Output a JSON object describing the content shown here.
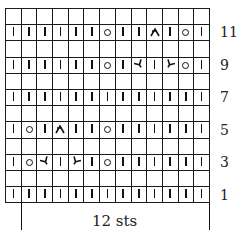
{
  "chart": {
    "columns": 13,
    "rows_top_to_bottom": [
      [
        "",
        "",
        "",
        "",
        "",
        "",
        "",
        "",
        "",
        "",
        "",
        "",
        ""
      ],
      [
        "k",
        "k",
        "k",
        "k",
        "k",
        "k",
        "yo",
        "k",
        "k",
        "s2kp",
        "k",
        "yo",
        "k"
      ],
      [
        "",
        "",
        "",
        "",
        "",
        "",
        "",
        "",
        "",
        "",
        "",
        "",
        ""
      ],
      [
        "k",
        "k",
        "k",
        "k",
        "k",
        "k",
        "yo",
        "k",
        "ssk",
        "k",
        "k2tog",
        "yo",
        "k"
      ],
      [
        "",
        "",
        "",
        "",
        "",
        "",
        "",
        "",
        "",
        "",
        "",
        "",
        ""
      ],
      [
        "k",
        "k",
        "k",
        "k",
        "k",
        "k",
        "k",
        "k",
        "k",
        "k",
        "k",
        "k",
        "k"
      ],
      [
        "",
        "",
        "",
        "",
        "",
        "",
        "",
        "",
        "",
        "",
        "",
        "",
        ""
      ],
      [
        "k",
        "yo",
        "k",
        "s2kp",
        "k",
        "k",
        "yo",
        "k",
        "k",
        "k",
        "k",
        "k",
        "k"
      ],
      [
        "",
        "",
        "",
        "",
        "",
        "",
        "",
        "",
        "",
        "",
        "",
        "",
        ""
      ],
      [
        "k",
        "yo",
        "ssk",
        "k",
        "k2tog",
        "k",
        "yo",
        "k",
        "k",
        "k",
        "k",
        "k",
        "k"
      ],
      [
        "",
        "",
        "",
        "",
        "",
        "",
        "",
        "",
        "",
        "",
        "",
        "",
        ""
      ],
      [
        "k",
        "k",
        "k",
        "k",
        "k",
        "k",
        "k",
        "k",
        "k",
        "k",
        "k",
        "k",
        "k"
      ]
    ],
    "row_labels": [
      {
        "label": "11",
        "row_index": 1
      },
      {
        "label": "9",
        "row_index": 3
      },
      {
        "label": "7",
        "row_index": 5
      },
      {
        "label": "5",
        "row_index": 7
      },
      {
        "label": "3",
        "row_index": 9
      },
      {
        "label": "1",
        "row_index": 11
      }
    ],
    "repeat_label": "12 sts",
    "symbols": {
      "k": "knit",
      "yo": "yarn over",
      "ssk": "slip slip knit",
      "k2tog": "knit two together",
      "s2kp": "centered double decrease"
    }
  }
}
